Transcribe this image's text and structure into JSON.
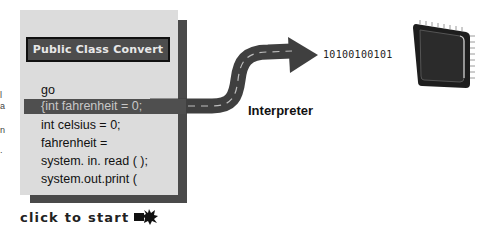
{
  "panel": {
    "title": "Public Class Convert",
    "code_lines": [
      "go",
      "{int fahrenheit = 0;",
      "int celsius = 0;",
      "fahrenheit =",
      "system. in. read ( );",
      "system.out.print ("
    ],
    "highlighted_line_index": 1
  },
  "diagram": {
    "process_label": "Interpreter",
    "output_binary": "10100100101",
    "target_icon": "cpu-chip-icon"
  },
  "controls": {
    "start_label": "click to start",
    "start_icon": "starburst-arrow-icon"
  },
  "edge_fragments": [
    "l",
    "a",
    "n",
    "."
  ],
  "colors": {
    "panel_bg": "#dcdcdc",
    "panel_shadow": "#4a4a4a",
    "highlight_bg": "#4f4f4f",
    "road": "#3f3f3f",
    "road_dash": "#bdbdbd"
  }
}
